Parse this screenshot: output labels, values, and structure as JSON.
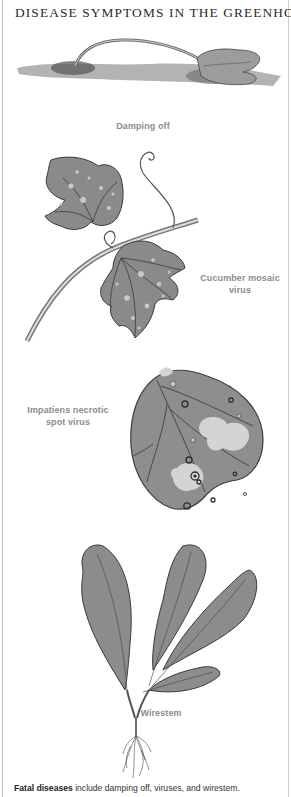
{
  "page": {
    "title": "DISEASE SYMPTOMS IN THE GREENHOUSE"
  },
  "illustrations": [
    {
      "id": "damping-off",
      "caption": "Damping off"
    },
    {
      "id": "cucumber-mosaic-virus",
      "caption_line1": "Cucumber mosaic",
      "caption_line2": "virus"
    },
    {
      "id": "impatiens-necrotic-spot-virus",
      "caption_line1": "Impatiens necrotic",
      "caption_line2": "spot virus"
    },
    {
      "id": "wirestem",
      "caption": "Wirestem"
    }
  ],
  "footer": {
    "bold": "Fatal diseases",
    "text": " include damping off, viruses, and wirestem."
  },
  "colors": {
    "caption": "#8c8c8c",
    "title": "#2a2a2a",
    "leaf_fill": "#8a8a8a",
    "frame": "#bdbdbd"
  }
}
